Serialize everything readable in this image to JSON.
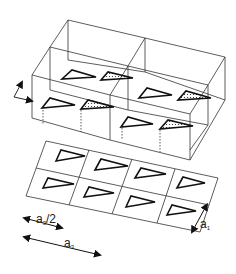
{
  "diagram": {
    "type": "crystal-lattice-schematic",
    "upper_block": {
      "description": "3D box of 2x2 unit cells containing triangular molecules (open and dotted)",
      "cells": 4
    },
    "lower_layer": {
      "description": "Flat 2D grid of 2 rows x 4 columns with open triangles",
      "rows": 2,
      "columns": 4
    },
    "labels": {
      "half_a3_main": "a",
      "half_a3_sub": "3",
      "half_a3_suffix": "/2",
      "a3_main": "a",
      "a3_sub": "3",
      "a1_main": "a",
      "a1_sub": "1"
    },
    "colors": {
      "line": "#333333",
      "fill": "#ffffff"
    }
  }
}
